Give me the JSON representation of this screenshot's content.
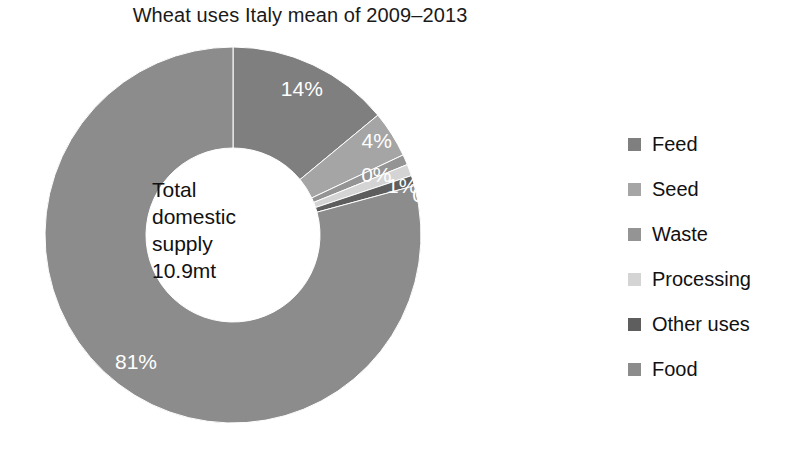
{
  "chart_data": {
    "type": "pie",
    "variant": "donut",
    "title": "Wheat uses Italy mean of 2009–2013",
    "categories": [
      "Feed",
      "Seed",
      "Waste",
      "Processing",
      "Other uses",
      "Food"
    ],
    "values": [
      14,
      4,
      0,
      1,
      0,
      81
    ],
    "value_labels": [
      "14%",
      "4%",
      "0%",
      "1%",
      "0%",
      "81%"
    ],
    "unit": "percent",
    "legend_position": "right",
    "grid": false,
    "xlabel": "",
    "ylabel": "",
    "start_angle_deg": 0,
    "direction": "clockwise",
    "colors": [
      "#7f7f7f",
      "#a5a5a5",
      "#949494",
      "#d4d4d4",
      "#5e5e5e",
      "#8c8c8c"
    ],
    "label_color": "#ffffff",
    "center_annotation": {
      "lines": [
        "Total",
        "domestic",
        "supply",
        "10.9mt"
      ],
      "total_label": "Total domestic supply",
      "total_value": "10.9mt"
    }
  },
  "legend": {
    "items": [
      {
        "label": "Feed",
        "color": "#7f7f7f"
      },
      {
        "label": "Seed",
        "color": "#a5a5a5"
      },
      {
        "label": "Waste",
        "color": "#949494"
      },
      {
        "label": "Processing",
        "color": "#d4d4d4"
      },
      {
        "label": "Other uses",
        "color": "#5e5e5e"
      },
      {
        "label": "Food",
        "color": "#8c8c8c"
      }
    ]
  }
}
